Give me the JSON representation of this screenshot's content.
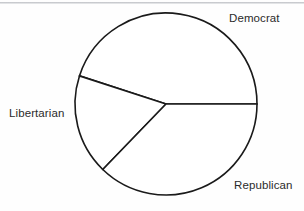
{
  "chart_data": {
    "type": "pie",
    "title": "",
    "subtitle": "",
    "xlabel": "",
    "ylabel": "",
    "legend_position": "none",
    "grid": false,
    "labels_outside": true,
    "center": {
      "x": 166,
      "y": 104
    },
    "radius": 91,
    "start_angle_deg": 0,
    "direction": "counterclockwise",
    "categories": [
      "Democrat",
      "Libertarian",
      "Republican"
    ],
    "values": [
      45,
      18,
      37
    ],
    "value_unit": "percent",
    "slices": [
      {
        "label": "Democrat",
        "value": 45,
        "percent": 45,
        "start_angle_deg": 0,
        "end_angle_deg": 162,
        "sweep_deg": 162,
        "fill": "#ffffff",
        "stroke": "#1a1a1a",
        "label_position": "top-right"
      },
      {
        "label": "Libertarian",
        "value": 18,
        "percent": 18,
        "start_angle_deg": 162,
        "end_angle_deg": 226,
        "sweep_deg": 64,
        "fill": "#ffffff",
        "stroke": "#1a1a1a",
        "label_position": "left"
      },
      {
        "label": "Republican",
        "value": 37,
        "percent": 37,
        "start_angle_deg": 226,
        "end_angle_deg": 360,
        "sweep_deg": 134,
        "fill": "#ffffff",
        "stroke": "#1a1a1a",
        "label_position": "bottom-right"
      }
    ],
    "colors": {
      "background": "#fefefe",
      "outline": "#1a1a1a",
      "text": "#2b2b2b",
      "scan_rule": "#b9bcc0"
    }
  },
  "labels": {
    "democrat": "Democrat",
    "libertarian": "Libertarian",
    "republican": "Republican"
  }
}
